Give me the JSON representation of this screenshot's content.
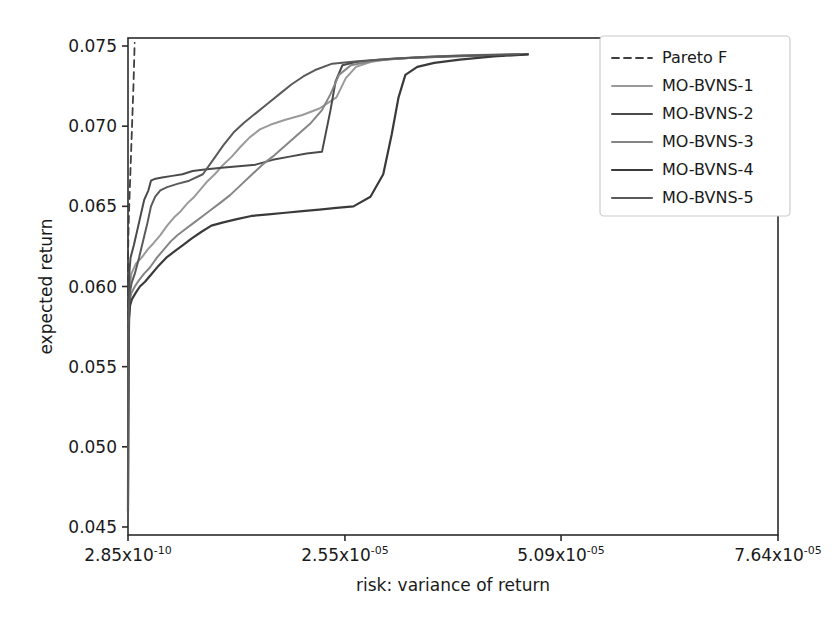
{
  "chart_data": {
    "type": "line",
    "title": "",
    "xlabel": "risk: variance of return",
    "ylabel": "expected return",
    "grid": false,
    "legend_position": "upper right",
    "xlim": [
      0,
      7.64e-05
    ],
    "ylim": [
      0.0445,
      0.0755
    ],
    "xticks": [
      2.85e-10,
      2.55e-05,
      5.09e-05,
      7.64e-05
    ],
    "xtick_labels": [
      "2.85x10-10",
      "2.55x10-05",
      "5.09x10-05",
      "7.64x10-05"
    ],
    "xtick_mantissas": [
      "2.85",
      "2.55",
      "5.09",
      "7.64"
    ],
    "xtick_exponents": [
      "-10",
      "-05",
      "-05",
      "-05"
    ],
    "yticks": [
      0.045,
      0.05,
      0.055,
      0.06,
      0.065,
      0.07,
      0.075
    ],
    "ytick_labels": [
      "0.045",
      "0.050",
      "0.055",
      "0.060",
      "0.065",
      "0.070",
      "0.075"
    ],
    "series": [
      {
        "name": "Pareto F",
        "style": "dashed",
        "color": "#3f3f3f",
        "width": 1.8,
        "points": [
          [
            0.0,
            0.046
          ],
          [
            3e-10,
            0.05
          ],
          [
            6e-10,
            0.054
          ],
          [
            1e-09,
            0.0575
          ],
          [
            1.6e-09,
            0.06
          ],
          [
            2.4e-09,
            0.0618
          ],
          [
            6e-08,
            0.0635
          ],
          [
            1.4e-07,
            0.065
          ],
          [
            2.4e-07,
            0.0665
          ],
          [
            3.4e-07,
            0.068
          ],
          [
            4.4e-07,
            0.0695
          ],
          [
            5.4e-07,
            0.071
          ],
          [
            6.4e-07,
            0.0725
          ],
          [
            7.2e-07,
            0.074
          ],
          [
            7.8e-07,
            0.0752
          ]
        ]
      },
      {
        "name": "MO-BVNS-1",
        "style": "solid",
        "color": "#9a9a9a",
        "width": 2.0,
        "points": [
          [
            0.0,
            0.046
          ],
          [
            2e-08,
            0.051
          ],
          [
            5e-08,
            0.055
          ],
          [
            1e-07,
            0.058
          ],
          [
            2e-07,
            0.0598
          ],
          [
            4e-07,
            0.0608
          ],
          [
            9e-07,
            0.0614
          ],
          [
            1.6e-06,
            0.0618
          ],
          [
            2.3e-06,
            0.0623
          ],
          [
            3e-06,
            0.0627
          ],
          [
            3.8e-06,
            0.0632
          ],
          [
            4.6e-06,
            0.0638
          ],
          [
            5.4e-06,
            0.0643
          ],
          [
            6.2e-06,
            0.0647
          ],
          [
            7e-06,
            0.0652
          ],
          [
            7.8e-06,
            0.0656
          ],
          [
            8.6e-06,
            0.0661
          ],
          [
            9.4e-06,
            0.0666
          ],
          [
            1.02e-05,
            0.067
          ],
          [
            1.12e-05,
            0.0676
          ],
          [
            1.22e-05,
            0.0681
          ],
          [
            1.32e-05,
            0.0687
          ],
          [
            1.43e-05,
            0.0693
          ],
          [
            1.55e-05,
            0.0698
          ],
          [
            1.68e-05,
            0.0701
          ],
          [
            1.85e-05,
            0.0704
          ],
          [
            2.05e-05,
            0.0707
          ],
          [
            2.25e-05,
            0.0711
          ],
          [
            2.45e-05,
            0.0718
          ],
          [
            2.56e-05,
            0.073
          ],
          [
            2.68e-05,
            0.0737
          ],
          [
            2.85e-05,
            0.074
          ],
          [
            3.1e-05,
            0.0742
          ],
          [
            3.4e-05,
            0.0743
          ],
          [
            3.8e-05,
            0.0744
          ],
          [
            4.2e-05,
            0.07445
          ],
          [
            4.6e-05,
            0.07448
          ]
        ]
      },
      {
        "name": "MO-BVNS-2",
        "style": "solid",
        "color": "#4a4a4a",
        "width": 2.0,
        "points": [
          [
            0.0,
            0.046
          ],
          [
            2e-08,
            0.052
          ],
          [
            5e-08,
            0.0565
          ],
          [
            1e-07,
            0.0595
          ],
          [
            1.8e-07,
            0.061
          ],
          [
            3e-07,
            0.0618
          ],
          [
            7e-07,
            0.0626
          ],
          [
            1.3e-06,
            0.064
          ],
          [
            1.9e-06,
            0.0654
          ],
          [
            2.4e-06,
            0.066
          ],
          [
            2.7e-06,
            0.0666
          ],
          [
            3.1e-06,
            0.0667
          ],
          [
            4e-06,
            0.0668
          ],
          [
            5.2e-06,
            0.0669
          ],
          [
            6.4e-06,
            0.067
          ],
          [
            7.6e-06,
            0.0672
          ],
          [
            9e-06,
            0.0673
          ],
          [
            1.1e-05,
            0.0674
          ],
          [
            1.3e-05,
            0.0675
          ],
          [
            1.5e-05,
            0.0676
          ],
          [
            1.7e-05,
            0.0679
          ],
          [
            1.9e-05,
            0.0681
          ],
          [
            2.1e-05,
            0.0683
          ],
          [
            2.28e-05,
            0.0684
          ],
          [
            2.38e-05,
            0.071
          ],
          [
            2.44e-05,
            0.0728
          ],
          [
            2.52e-05,
            0.0738
          ],
          [
            2.68e-05,
            0.074
          ],
          [
            2.95e-05,
            0.07415
          ],
          [
            3.3e-05,
            0.07425
          ],
          [
            3.8e-05,
            0.07435
          ],
          [
            4.3e-05,
            0.07442
          ],
          [
            4.7e-05,
            0.07448
          ]
        ]
      },
      {
        "name": "MO-BVNS-3",
        "style": "solid",
        "color": "#858585",
        "width": 2.0,
        "points": [
          [
            0.0,
            0.046
          ],
          [
            2e-08,
            0.0505
          ],
          [
            6e-08,
            0.055
          ],
          [
            1.2e-07,
            0.058
          ],
          [
            2.2e-07,
            0.0592
          ],
          [
            4e-07,
            0.0596
          ],
          [
            8e-07,
            0.06
          ],
          [
            1.3e-06,
            0.0604
          ],
          [
            1.9e-06,
            0.0608
          ],
          [
            2.6e-06,
            0.0612
          ],
          [
            3.4e-06,
            0.0618
          ],
          [
            4.2e-06,
            0.0623
          ],
          [
            5e-06,
            0.0628
          ],
          [
            5.8e-06,
            0.0632
          ],
          [
            6.8e-06,
            0.0636
          ],
          [
            7.8e-06,
            0.064
          ],
          [
            8.8e-06,
            0.0644
          ],
          [
            9.8e-06,
            0.0648
          ],
          [
            1.08e-05,
            0.0652
          ],
          [
            1.2e-05,
            0.0657
          ],
          [
            1.34e-05,
            0.0664
          ],
          [
            1.46e-05,
            0.067
          ],
          [
            1.58e-05,
            0.0676
          ],
          [
            1.7e-05,
            0.0681
          ],
          [
            1.85e-05,
            0.0688
          ],
          [
            2e-05,
            0.0695
          ],
          [
            2.15e-05,
            0.0702
          ],
          [
            2.28e-05,
            0.071
          ],
          [
            2.38e-05,
            0.072
          ],
          [
            2.48e-05,
            0.0732
          ],
          [
            2.62e-05,
            0.0738
          ],
          [
            2.9e-05,
            0.0741
          ],
          [
            3.3e-05,
            0.07425
          ],
          [
            3.8e-05,
            0.07438
          ],
          [
            4.3e-05,
            0.07444
          ],
          [
            4.7e-05,
            0.07448
          ]
        ]
      },
      {
        "name": "MO-BVNS-4",
        "style": "solid",
        "color": "#3a3a3a",
        "width": 2.2,
        "points": [
          [
            0.0,
            0.046
          ],
          [
            2e-08,
            0.051
          ],
          [
            6e-08,
            0.0555
          ],
          [
            1.3e-07,
            0.058
          ],
          [
            2.4e-07,
            0.0588
          ],
          [
            4.5e-07,
            0.0592
          ],
          [
            9e-07,
            0.0596
          ],
          [
            1.4e-06,
            0.06
          ],
          [
            2e-06,
            0.0603
          ],
          [
            2.8e-06,
            0.0608
          ],
          [
            3.6e-06,
            0.0613
          ],
          [
            4.5e-06,
            0.0618
          ],
          [
            5.5e-06,
            0.0622
          ],
          [
            6.5e-06,
            0.0626
          ],
          [
            7.5e-06,
            0.063
          ],
          [
            8.6e-06,
            0.0634
          ],
          [
            9.8e-06,
            0.0638
          ],
          [
            1.12e-05,
            0.064
          ],
          [
            1.28e-05,
            0.0642
          ],
          [
            1.45e-05,
            0.0644
          ],
          [
            1.65e-05,
            0.0645
          ],
          [
            1.85e-05,
            0.0646
          ],
          [
            2.05e-05,
            0.0647
          ],
          [
            2.25e-05,
            0.0648
          ],
          [
            2.45e-05,
            0.0649
          ],
          [
            2.65e-05,
            0.065
          ],
          [
            2.85e-05,
            0.0656
          ],
          [
            3e-05,
            0.067
          ],
          [
            3.1e-05,
            0.0695
          ],
          [
            3.18e-05,
            0.0718
          ],
          [
            3.26e-05,
            0.0732
          ],
          [
            3.4e-05,
            0.0737
          ],
          [
            3.6e-05,
            0.07395
          ],
          [
            3.9e-05,
            0.07415
          ],
          [
            4.3e-05,
            0.07435
          ],
          [
            4.7e-05,
            0.07448
          ]
        ]
      },
      {
        "name": "MO-BVNS-5",
        "style": "solid",
        "color": "#5a5a5a",
        "width": 2.0,
        "points": [
          [
            0.0,
            0.046
          ],
          [
            2e-08,
            0.0515
          ],
          [
            6e-08,
            0.056
          ],
          [
            1.2e-07,
            0.0585
          ],
          [
            2.2e-07,
            0.0596
          ],
          [
            4.2e-07,
            0.0602
          ],
          [
            8e-07,
            0.0608
          ],
          [
            1.3e-06,
            0.0618
          ],
          [
            1.8e-06,
            0.0629
          ],
          [
            2.3e-06,
            0.064
          ],
          [
            2.7e-06,
            0.065
          ],
          [
            3.2e-06,
            0.0656
          ],
          [
            3.8e-06,
            0.066
          ],
          [
            4.6e-06,
            0.0662
          ],
          [
            5.8e-06,
            0.0664
          ],
          [
            7.2e-06,
            0.0666
          ],
          [
            8.8e-06,
            0.067
          ],
          [
            1e-05,
            0.0679
          ],
          [
            1.12e-05,
            0.0688
          ],
          [
            1.24e-05,
            0.0696
          ],
          [
            1.36e-05,
            0.0702
          ],
          [
            1.5e-05,
            0.0708
          ],
          [
            1.64e-05,
            0.0714
          ],
          [
            1.78e-05,
            0.072
          ],
          [
            1.92e-05,
            0.0726
          ],
          [
            2.06e-05,
            0.0731
          ],
          [
            2.2e-05,
            0.0735
          ],
          [
            2.4e-05,
            0.0739
          ],
          [
            2.7e-05,
            0.07405
          ],
          [
            3.1e-05,
            0.0742
          ],
          [
            3.6e-05,
            0.07435
          ],
          [
            4.1e-05,
            0.07443
          ],
          [
            4.6e-05,
            0.07448
          ]
        ]
      }
    ],
    "legend_entries": [
      "Pareto F",
      "MO-BVNS-1",
      "MO-BVNS-2",
      "MO-BVNS-3",
      "MO-BVNS-4",
      "MO-BVNS-5"
    ]
  }
}
